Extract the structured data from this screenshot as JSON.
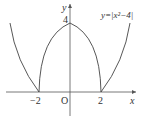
{
  "figure": {
    "function_label": "y=|x²−4|",
    "axis_x_label": "x",
    "axis_y_label": "y",
    "origin_label": "O",
    "tick_labels": {
      "x_neg2": "−2",
      "x_pos2": "2",
      "y_4": "4"
    },
    "colors": {
      "curve": "#444444",
      "axis": "#555555",
      "text": "#333333"
    }
  }
}
